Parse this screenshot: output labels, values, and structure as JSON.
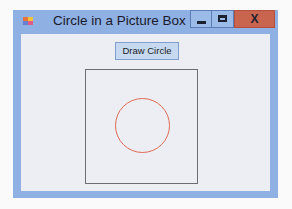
{
  "window": {
    "title": "Circle in a Picture Box",
    "icon": "app-form-icon",
    "controls": {
      "minimize": "minimize-icon",
      "maximize": "maximize-icon",
      "close_label": "X"
    }
  },
  "form": {
    "draw_button_label": "Draw Circle",
    "picture_box": {
      "shape": "circle",
      "circle_color": "#e06a55",
      "border_color": "#6e6e72"
    }
  },
  "colors": {
    "frame": "#8fb0e3",
    "close_button": "#c9654f",
    "client_bg": "#eceef3"
  }
}
